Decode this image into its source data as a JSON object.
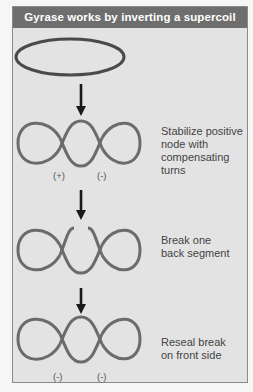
{
  "title": "Gyrase works by inverting a supercoil",
  "steps": [
    {
      "caption": "Stabilize positive node with compensating turns",
      "lines": [
        "Stabilize positive",
        "node with",
        "compensating",
        "turns"
      ],
      "signs": [
        "(+)",
        "(-)"
      ]
    },
    {
      "caption": "Break one back segment",
      "lines": [
        "Break one",
        "back segment"
      ],
      "signs": []
    },
    {
      "caption": "Reseal break on front side",
      "lines": [
        "Reseal break",
        "on front side"
      ],
      "signs": [
        "(-)",
        "(-)"
      ]
    }
  ],
  "colors": {
    "header": "#6e6e6e",
    "panel": "#e3e3e3",
    "strand": "#6a6a6a",
    "arrow": "#1a1a1a"
  }
}
